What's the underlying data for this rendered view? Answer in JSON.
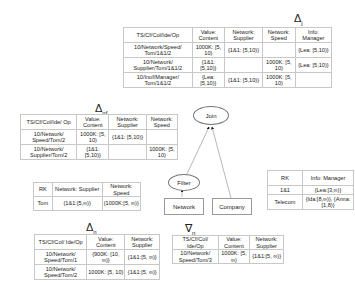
{
  "delta_j": {
    "title": "Δ",
    "subscript": "j",
    "headers": [
      "TS/Cf/Col/Ide/Op",
      "Value: Content",
      "Network: Supplier",
      "Network: Speed",
      "Info: Manager"
    ],
    "rows": [
      [
        "10/Network/Speed/ Tom/1&1/2",
        "1000K: [5, 10)",
        "{1&1: [5,10)}",
        "",
        "{Lea: [5,10)}"
      ],
      [
        "10/Network/ Supplier/Tom/1&1/2",
        "{1&1: [5,10)}",
        "",
        "1000K: [5, 10)",
        "{Lea: [5,10)}"
      ],
      [
        "10/Inof/Manager/ Tom/1&1/2",
        "{Lea: [5,10)}",
        "{1&1: [5,10)}",
        "1000K: [5, 10)",
        ""
      ]
    ]
  },
  "delta_nf": {
    "title": "Δ",
    "subscript": "nf",
    "headers": [
      "TS/Cf/Col/Ide/ Op",
      "Value: Content",
      "Network: Supplier",
      "Network: Speed"
    ],
    "rows": [
      [
        "10/Network/ Speed/Tom/2",
        "1000K: [5, 10)",
        "{1&1: [5,10)}",
        ""
      ],
      [
        "10/Network/ Supplier/Tom/2",
        "{1&1: [5,10)}",
        "",
        "1000K: [5, 10)"
      ]
    ]
  },
  "rk_network": {
    "headers": [
      "RK",
      "Network: Supplier",
      "Network: Speed"
    ],
    "rows": [
      [
        "Tom",
        "{1&1:[5,∞)}",
        "{1000K:[5, ∞)}"
      ]
    ]
  },
  "rk_info": {
    "headers": [
      "RK",
      "Info: Manager"
    ],
    "rows": [
      [
        "1&1",
        "{Lea:[3,∞)}"
      ],
      [
        "Telecom",
        "{Ida:[8,∞)}, {Anna:[1,8)}"
      ]
    ]
  },
  "delta_n": {
    "title": "Δ",
    "subscript": "n",
    "headers": [
      "TS/Cf/Col/ Ide/Op",
      "Value: Content",
      "Network: Supplier"
    ],
    "rows": [
      [
        "10/Network/ Speed/Tom/1",
        "{900K: [10, ∞)}",
        "{1&1:[5, ∞)}"
      ],
      [
        "10/Network/ Speed/Tom/2",
        "1000K: [5, 10)",
        "{1&1:[5, ∞)}"
      ]
    ]
  },
  "nabla_n": {
    "title": "∇",
    "subscript": "n",
    "headers": [
      "TS/Cf/Col/ Ide/Op",
      "Value: Content",
      "Network: Supplier"
    ],
    "rows": [
      [
        "10/Network/ Speed/Tom/3",
        "1000K: [5, ∞)",
        "{1&1:[5, ∞)}"
      ]
    ]
  },
  "nodes": {
    "join": "Join",
    "filter": "Filter",
    "network": "Network",
    "company": "Company"
  }
}
